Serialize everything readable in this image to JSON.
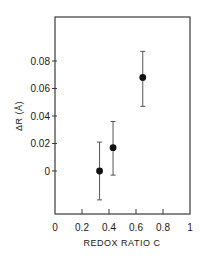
{
  "chart_data": {
    "type": "scatter",
    "title": "",
    "xlabel": "REDOX RATIO C",
    "ylabel": "ΔR (Å)",
    "xlim": [
      0,
      1
    ],
    "ylim": [
      -0.04,
      0.12
    ],
    "x_ticks": [
      0,
      0.2,
      0.4,
      0.6,
      0.8,
      1
    ],
    "x_tick_labels": [
      "0",
      "0.2",
      "0.4",
      "0.6",
      "0.8",
      "1"
    ],
    "y_ticks": [
      0,
      0.02,
      0.04,
      0.06,
      0.08
    ],
    "y_tick_labels": [
      "0",
      "0.02",
      "0.04",
      "0.06",
      "0.08"
    ],
    "grid": false,
    "legend": null,
    "series": [
      {
        "name": "ΔR vs redox ratio",
        "marker": "filled-circle",
        "color": "#111111",
        "points": [
          {
            "x": 0.33,
            "y": 0.0,
            "err_low": -0.021,
            "err_high": 0.021
          },
          {
            "x": 0.43,
            "y": 0.017,
            "err_low": -0.003,
            "err_high": 0.036
          },
          {
            "x": 0.65,
            "y": 0.068,
            "err_low": 0.047,
            "err_high": 0.087
          }
        ]
      }
    ]
  },
  "colors": {
    "ink": "#1a1a1a",
    "frame": "#3a3a3a",
    "background": "#ffffff"
  }
}
